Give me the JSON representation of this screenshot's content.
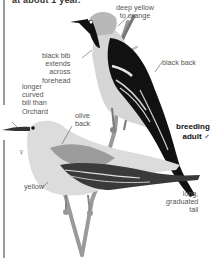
{
  "header": {
    "text": "at about 1 year."
  },
  "male": {
    "title": "breeding",
    "title2": "adult ♂",
    "labels": {
      "head": [
        "deep yellow",
        "to orange"
      ],
      "bib": [
        "black bib",
        "extends",
        "across",
        "forehead"
      ],
      "back": "black back",
      "tail": [
        "long,",
        "graduated",
        "tail"
      ]
    }
  },
  "female": {
    "symbol": "♀",
    "labels": {
      "bill": [
        "longer",
        "curved",
        "bill than",
        "Orchard"
      ],
      "back": [
        "olive",
        "back"
      ],
      "belly": "yellow"
    }
  },
  "colors": {
    "sidebar": "#9a9a9a",
    "label_text": "#555555",
    "bird_black": "#111111",
    "bird_gray_light": "#d8d8d8",
    "bird_gray_mid": "#a8a8a8"
  }
}
